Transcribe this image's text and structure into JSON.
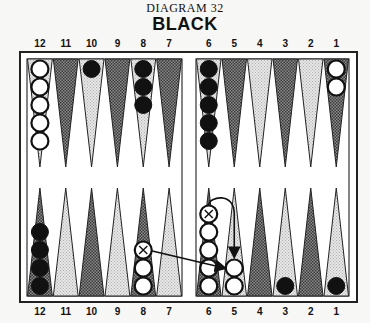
{
  "diagram": {
    "number_label": "DIAGRAM 32",
    "side_label": "BLACK"
  },
  "point_labels": {
    "top": [
      "12",
      "11",
      "10",
      "9",
      "8",
      "7",
      "6",
      "5",
      "4",
      "3",
      "2",
      "1"
    ],
    "bottom": [
      "12",
      "11",
      "10",
      "9",
      "8",
      "7",
      "6",
      "5",
      "4",
      "3",
      "2",
      "1"
    ]
  },
  "colors": {
    "black_checker": "#111111",
    "white_checker": "#ffffff",
    "dark_point": "#555555",
    "light_point": "#d8d8d8",
    "frame": "#222222"
  },
  "position": {
    "top": [
      {
        "point": "12",
        "color": "white",
        "count": 5
      },
      {
        "point": "11",
        "color": null,
        "count": 0
      },
      {
        "point": "10",
        "color": "black",
        "count": 1
      },
      {
        "point": "9",
        "color": null,
        "count": 0
      },
      {
        "point": "8",
        "color": "black",
        "count": 3
      },
      {
        "point": "7",
        "color": null,
        "count": 0
      },
      {
        "point": "6",
        "color": "black",
        "count": 5
      },
      {
        "point": "5",
        "color": null,
        "count": 0
      },
      {
        "point": "4",
        "color": null,
        "count": 0
      },
      {
        "point": "3",
        "color": null,
        "count": 0
      },
      {
        "point": "2",
        "color": null,
        "count": 0
      },
      {
        "point": "1",
        "color": "white",
        "count": 2
      }
    ],
    "bottom": [
      {
        "point": "12",
        "color": "black",
        "count": 4
      },
      {
        "point": "11",
        "color": null,
        "count": 0
      },
      {
        "point": "10",
        "color": null,
        "count": 0
      },
      {
        "point": "9",
        "color": null,
        "count": 0
      },
      {
        "point": "8",
        "color": "white",
        "count": 3,
        "marked_top": true
      },
      {
        "point": "7",
        "color": null,
        "count": 0
      },
      {
        "point": "6",
        "color": "white",
        "count": 5,
        "marked_top": true
      },
      {
        "point": "5",
        "color": "white",
        "count": 2
      },
      {
        "point": "4",
        "color": null,
        "count": 0
      },
      {
        "point": "3",
        "color": "black",
        "count": 1
      },
      {
        "point": "2",
        "color": null,
        "count": 0
      },
      {
        "point": "1",
        "color": "black",
        "count": 1
      }
    ]
  },
  "moves": [
    {
      "from": "bottom-8",
      "to": "bottom-5",
      "style": "straight"
    },
    {
      "from": "bottom-6",
      "to": "bottom-5",
      "style": "curved"
    }
  ]
}
